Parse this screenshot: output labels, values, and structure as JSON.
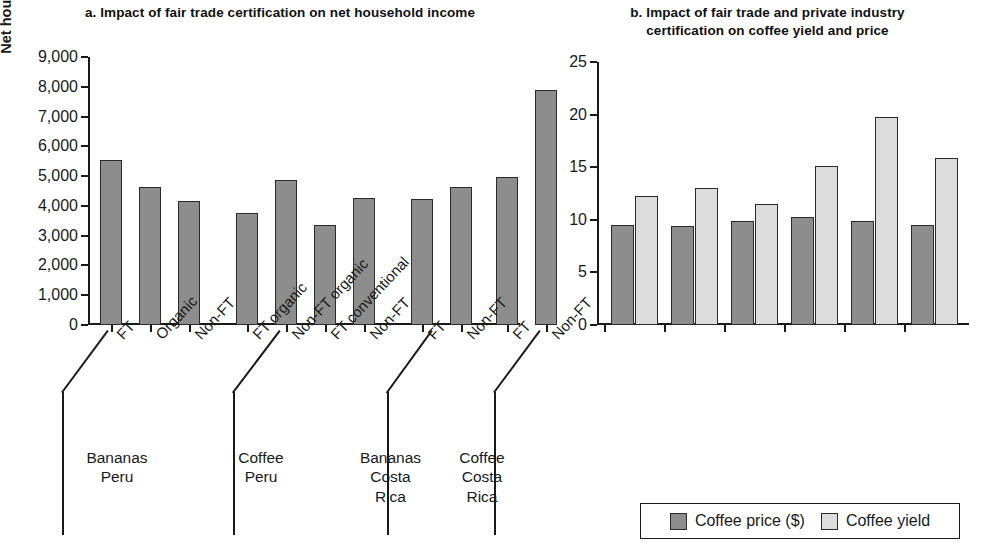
{
  "panel_a": {
    "title": "a. Impact of fair trade certification on net household income",
    "y_axis_label": "Net household income (US$)",
    "y_ticks": [
      "0",
      "1,000",
      "2,000",
      "3,000",
      "4,000",
      "5,000",
      "6,000",
      "7,000",
      "8,000",
      "9,000"
    ],
    "groups": [
      {
        "label_line1": "Bananas",
        "label_line2": "Peru",
        "label_line3": ""
      },
      {
        "label_line1": "Coffee",
        "label_line2": "Peru",
        "label_line3": ""
      },
      {
        "label_line1": "Bananas",
        "label_line2": "Costa",
        "label_line3": "Rica"
      },
      {
        "label_line1": "Coffee",
        "label_line2": "Costa",
        "label_line3": "Rica"
      }
    ]
  },
  "panel_b": {
    "title_line1": "b. Impact of fair trade and private industry",
    "title_line2": "certification on coffee yield and price",
    "y_ticks": [
      "0",
      "5",
      "10",
      "15",
      "20",
      "25"
    ],
    "legend": [
      {
        "label": "Coffee price ($)",
        "swatch": "dark",
        "color": "#8d8d8d"
      },
      {
        "label": "Coffee yield",
        "swatch": "light",
        "color": "#dcdcdc"
      }
    ]
  },
  "chart_data": [
    {
      "type": "bar",
      "title": "a. Impact of fair trade certification on net household income",
      "xlabel": "",
      "ylabel": "Net household income (US$)",
      "ylim": [
        0,
        9000
      ],
      "ytick_step": 1000,
      "grid": false,
      "categories": [
        "FT",
        "Organic",
        "Non-FT",
        "FT organic",
        "Non-FT organic",
        "FT conventional",
        "Non-FT",
        "FT",
        "Non-FT",
        "FT",
        "Non-FT"
      ],
      "values": [
        5550,
        4620,
        4180,
        3750,
        4880,
        3350,
        4270,
        4230,
        4620,
        4980,
        7900
      ],
      "group_labels": [
        "Bananas Peru",
        "Coffee Peru",
        "Bananas Costa Rica",
        "Coffee Costa Rica"
      ],
      "group_spans": [
        [
          0,
          2
        ],
        [
          3,
          6
        ],
        [
          7,
          8
        ],
        [
          9,
          10
        ]
      ],
      "bar_color": "#8d8d8d"
    },
    {
      "type": "bar",
      "title": "b. Impact of fair trade and private industry certification on coffee yield and price",
      "xlabel": "",
      "ylabel": "",
      "ylim": [
        0,
        25
      ],
      "ytick_step": 5,
      "grid": false,
      "categories": [
        "Fair trade",
        "FT conventional",
        "FT organic",
        "Rainforest Alliance of Nespresso",
        "Café Practices of Starbucks",
        "Independent farmers"
      ],
      "series": [
        {
          "name": "Coffee price ($)",
          "color": "#8d8d8d",
          "values": [
            9.5,
            9.4,
            9.9,
            10.3,
            9.9,
            9.5
          ]
        },
        {
          "name": "Coffee yield",
          "color": "#dcdcdc",
          "values": [
            12.3,
            13.0,
            11.5,
            15.1,
            19.8,
            15.9
          ]
        }
      ],
      "legend_position": "bottom"
    }
  ]
}
